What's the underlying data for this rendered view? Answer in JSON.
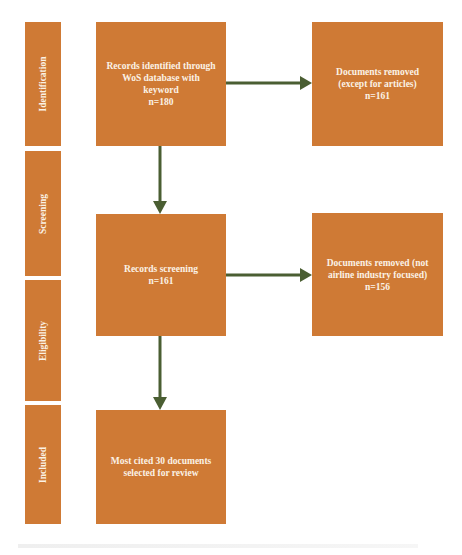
{
  "phases": [
    {
      "label": "Identification"
    },
    {
      "label": "Screening"
    },
    {
      "label": "Eligibility"
    },
    {
      "label": "Included"
    }
  ],
  "boxes": {
    "identified": {
      "lines": [
        "Records identified through",
        "WoS database with",
        "keyword",
        "n=180"
      ]
    },
    "removed_articles": {
      "lines": [
        "Documents removed",
        "(except for articles)",
        "n=161"
      ]
    },
    "screening": {
      "lines": [
        "Records screening",
        "n=161"
      ]
    },
    "removed_airline": {
      "lines": [
        "Documents removed (not",
        "airline industry focused)",
        "n=156"
      ]
    },
    "included": {
      "lines": [
        "Most cited 30 documents",
        "selected for review"
      ]
    }
  },
  "colors": {
    "box_fill": "#cf7a35",
    "box_text": "#fbf2e6",
    "arrow": "#4a5e32"
  }
}
